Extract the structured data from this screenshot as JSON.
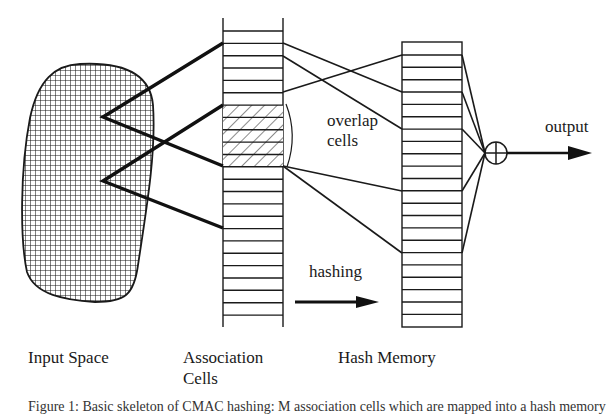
{
  "labels": {
    "input_space": "Input Space",
    "association_line1": "Association",
    "association_line2": "Cells",
    "hash_memory": "Hash Memory",
    "overlap_line1": "overlap",
    "overlap_line2": "cells",
    "hashing": "hashing",
    "output": "output"
  },
  "caption": "Figure 1: Basic skeleton of CMAC hashing: M association cells which are mapped into a hash memory",
  "colors": {
    "ink": "#1a1a1a",
    "background": "#ffffff"
  },
  "icons": {
    "sum_node": "circled-plus-icon",
    "output_arrow": "arrow-right-icon",
    "hashing_arrow": "arrow-right-icon"
  }
}
